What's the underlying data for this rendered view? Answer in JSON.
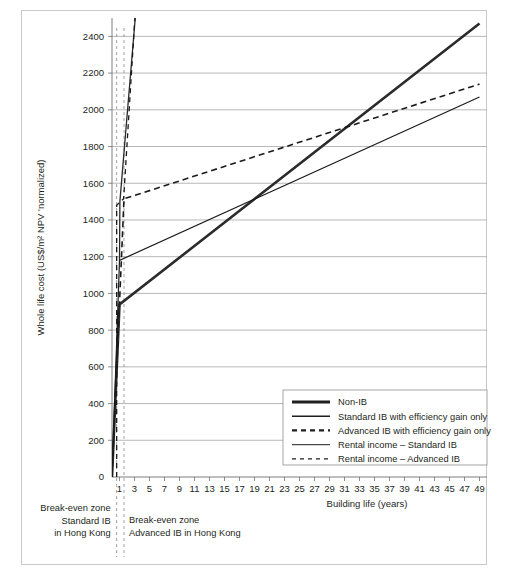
{
  "figure": {
    "background": "#ffffff",
    "frame_color": "#c9c9c9"
  },
  "chart_data": {
    "type": "line",
    "title": "",
    "xlabel": "Building life (years)",
    "ylabel": "Whole life cost (US$/m² NPV 'normalized)",
    "xlim": [
      0,
      50
    ],
    "ylim": [
      0,
      2500
    ],
    "ytick_values": [
      0,
      200,
      400,
      600,
      800,
      1000,
      1200,
      1400,
      1600,
      1800,
      2000,
      2200,
      2400
    ],
    "ytick_labels": [
      "0",
      "200",
      "400",
      "600",
      "800",
      "1000",
      "1200",
      "1400",
      "1600",
      "1800",
      "2000",
      "2200",
      "2400"
    ],
    "xtick_values": [
      1,
      3,
      5,
      7,
      9,
      11,
      13,
      15,
      17,
      19,
      21,
      23,
      25,
      27,
      29,
      31,
      33,
      35,
      37,
      39,
      41,
      43,
      45,
      47,
      49
    ],
    "xtick_labels": [
      "1",
      "3",
      "5",
      "7",
      "9",
      "11",
      "13",
      "15",
      "17",
      "19",
      "21",
      "23",
      "25",
      "27",
      "29",
      "31",
      "33",
      "35",
      "37",
      "39",
      "41",
      "43",
      "45",
      "47",
      "49"
    ],
    "grid": "horizontal",
    "legend_position": "lower right",
    "series": [
      {
        "name": "Non-IB",
        "style": "solid-thick",
        "color": "#2b2b2b",
        "width": 2.6,
        "points": [
          [
            0,
            0
          ],
          [
            1,
            940
          ],
          [
            49,
            2470
          ]
        ]
      },
      {
        "name": "Standard IB with efficiency gain only",
        "style": "solid-thin",
        "color": "#1a1a1a",
        "width": 1.2,
        "points": [
          [
            0,
            0
          ],
          [
            1,
            1180
          ],
          [
            49,
            2070
          ]
        ]
      },
      {
        "name": "Advanced IB with efficiency gain only",
        "style": "dashed-thick",
        "color": "#1a1a1a",
        "width": 1.6,
        "points": [
          [
            0,
            0
          ],
          [
            1.6,
            1515
          ],
          [
            49,
            2140
          ]
        ]
      },
      {
        "name": "Rental income – Standard IB",
        "style": "solid-steep",
        "color": "#2b2b2b",
        "width": 1.3,
        "points": [
          [
            1,
            1180
          ],
          [
            1.05,
            1500
          ],
          [
            3.1,
            2500
          ]
        ]
      },
      {
        "name": "Rental income – Advanced IB",
        "style": "dashed-steep",
        "color": "#1a1a1a",
        "width": 1.3,
        "points": [
          [
            0.62,
            0
          ],
          [
            0.62,
            1480
          ],
          [
            1.55,
            1515
          ],
          [
            3.05,
            2500
          ]
        ]
      }
    ],
    "breakeven_lines": [
      {
        "x": 0.62,
        "label": "break-even-standard"
      },
      {
        "x": 1.6,
        "label": "break-even-advanced"
      }
    ],
    "annotations": [
      {
        "id": "break-even-standard-note",
        "lines": [
          "Break-even zone",
          "Standard IB",
          "in Hong Kong"
        ],
        "align": "right"
      },
      {
        "id": "break-even-advanced-note",
        "lines": [
          "Break-even zone",
          "Advanced IB in Hong Kong"
        ],
        "align": "left"
      }
    ]
  },
  "legend": {
    "items": [
      {
        "label": "Non-IB",
        "style": "solid-thick"
      },
      {
        "label": "Standard IB with efficiency gain only",
        "style": "solid-medium"
      },
      {
        "label": "Advanced IB with efficiency gain only",
        "style": "dashed-thick"
      },
      {
        "label": "Rental income – Standard IB",
        "style": "solid-thin"
      },
      {
        "label": "Rental income – Advanced IB",
        "style": "dashed-thin"
      }
    ]
  }
}
